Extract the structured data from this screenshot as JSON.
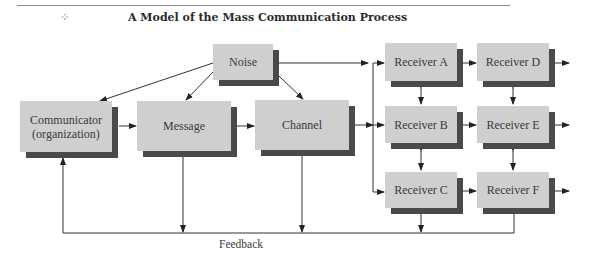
{
  "header": {
    "title": "A Model of the Mass Communication Process",
    "ornament": "⁘"
  },
  "diagram": {
    "nodes": {
      "noise": "Noise",
      "communicator_line1": "Communicator",
      "communicator_line2": "(organization)",
      "message": "Message",
      "channel": "Channel",
      "receiver_a": "Receiver A",
      "receiver_b": "Receiver B",
      "receiver_c": "Receiver C",
      "receiver_d": "Receiver D",
      "receiver_e": "Receiver E",
      "receiver_f": "Receiver F"
    },
    "feedback_label": "Feedback",
    "colors": {
      "box_fill": "#cfcfcf",
      "box_shadow": "#4a4a4a",
      "line": "#333333"
    }
  }
}
